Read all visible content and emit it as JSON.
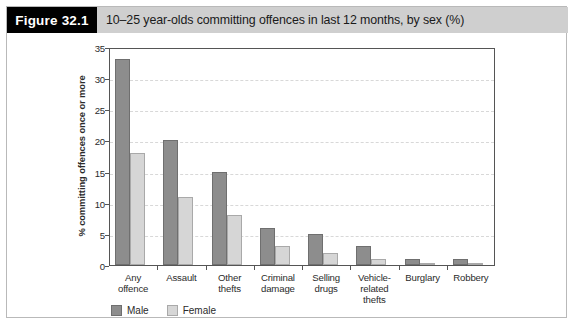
{
  "figure": {
    "tag": "Figure 32.1",
    "title": "10–25 year-olds committing offences in last 12 months, by sex (%)"
  },
  "colors": {
    "male": "#8d8d8d",
    "male_edge": "#6f6f6f",
    "female": "#d6d6d6",
    "female_edge": "#a9a9a9",
    "tag_background": "#000000",
    "title_background": "#cfcfcf",
    "axis": "#555555",
    "gridline": "#d8d8d8",
    "frame": "#b9b9b9"
  },
  "legend": {
    "position": "bottom-left",
    "items": [
      {
        "label": "Male",
        "key": "male"
      },
      {
        "label": "Female",
        "key": "female"
      }
    ]
  },
  "chart_data": {
    "type": "bar",
    "title": "10–25 year-olds committing offences in last 12 months, by sex (%)",
    "xlabel": "",
    "ylabel": "% committing offences once or more",
    "ylim": [
      0,
      35
    ],
    "yticks": [
      0,
      5,
      10,
      15,
      20,
      25,
      30,
      35
    ],
    "ytick_labels": [
      "0",
      "5",
      "10",
      "15",
      "20",
      "25",
      "30",
      "35"
    ],
    "grid": true,
    "grid_axis": "y",
    "legend_position": "bottom-left",
    "categories": [
      "Any offence",
      "Assault",
      "Other thefts",
      "Criminal damage",
      "Selling drugs",
      "Vehicle-related thefts",
      "Burglary",
      "Robbery"
    ],
    "category_lines": [
      [
        "Any",
        "offence"
      ],
      [
        "Assault"
      ],
      [
        "Other",
        "thefts"
      ],
      [
        "Criminal",
        "damage"
      ],
      [
        "Selling",
        "drugs"
      ],
      [
        "Vehicle-",
        "related",
        "thefts"
      ],
      [
        "Burglary"
      ],
      [
        "Robbery"
      ]
    ],
    "series": [
      {
        "name": "Male",
        "key": "male",
        "values": [
          33,
          20,
          15,
          6,
          5,
          3,
          1,
          1
        ]
      },
      {
        "name": "Female",
        "key": "female",
        "values": [
          18,
          11,
          8,
          3,
          2,
          1,
          0.4,
          0.3
        ]
      }
    ]
  }
}
